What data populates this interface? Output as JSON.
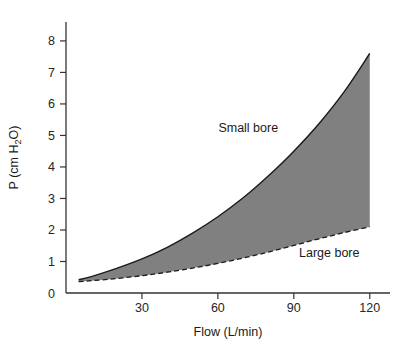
{
  "chart_data": {
    "type": "area",
    "title": "",
    "xlabel": "Flow (L/min)",
    "ylabel": "P (cm H2O)",
    "ylabel_parts": {
      "lead": "P (cm H",
      "sub": "2",
      "trail": "O)"
    },
    "xlim": [
      0,
      128
    ],
    "ylim": [
      0,
      8.6
    ],
    "xticks": [
      30,
      60,
      90,
      120
    ],
    "xtick_labels": [
      "30",
      "60",
      "90",
      "120"
    ],
    "yticks": [
      0,
      1,
      2,
      3,
      4,
      5,
      6,
      7,
      8
    ],
    "ytick_labels": [
      "0",
      "1",
      "2",
      "3",
      "4",
      "5",
      "6",
      "7",
      "8"
    ],
    "grid": false,
    "legend_position": "inline-annotations",
    "fill_color": "#808080",
    "line_color": "#1a1a1a",
    "axis_color": "#333333",
    "background_color": "#ffffff",
    "annotations": [
      {
        "text": "Small bore",
        "x": 72,
        "y": 5.1
      },
      {
        "text": "Large bore",
        "x": 104,
        "y": 1.15
      }
    ],
    "series": [
      {
        "name": "Small bore",
        "style": "solid",
        "x": [
          5,
          10,
          20,
          30,
          40,
          50,
          60,
          70,
          80,
          90,
          100,
          110,
          120
        ],
        "values": [
          0.42,
          0.52,
          0.78,
          1.08,
          1.45,
          1.9,
          2.42,
          3.02,
          3.72,
          4.5,
          5.38,
          6.4,
          7.6
        ]
      },
      {
        "name": "Large bore",
        "style": "dashed",
        "x": [
          5,
          10,
          20,
          30,
          40,
          50,
          60,
          70,
          80,
          90,
          100,
          110,
          120
        ],
        "values": [
          0.36,
          0.39,
          0.46,
          0.55,
          0.66,
          0.79,
          0.94,
          1.11,
          1.3,
          1.51,
          1.72,
          1.92,
          2.1
        ]
      }
    ]
  }
}
